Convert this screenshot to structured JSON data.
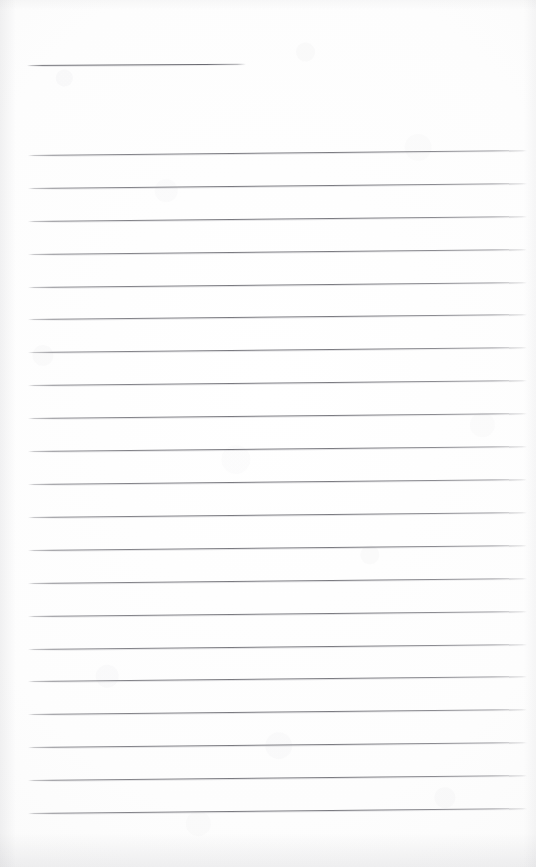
{
  "document": {
    "kind": "scanned-blank-ruled-page",
    "title": "Blank Ruled Notepad Page",
    "page_width": 536,
    "page_height": 867,
    "paper_color": "#fefefe",
    "rule_color": "#7a7a80",
    "rule_thickness_px": 1,
    "has_written_content": false,
    "has_handwriting": false,
    "has_margin_rule": false,
    "content_text": ""
  },
  "header_rule": {
    "label": "header-rule",
    "x": 27,
    "y": 65,
    "width": 219,
    "skew_deg": -0.35
  },
  "ruling": {
    "label": "ruled-lines",
    "line_count": 21,
    "left_x": 28,
    "right_x": 527,
    "first_line_y": 155,
    "line_spacing_px": 32.9,
    "skew_deg": -0.55,
    "lines": [
      {
        "index": 1,
        "y": 155
      },
      {
        "index": 2,
        "y": 188
      },
      {
        "index": 3,
        "y": 221
      },
      {
        "index": 4,
        "y": 254
      },
      {
        "index": 5,
        "y": 287
      },
      {
        "index": 6,
        "y": 319
      },
      {
        "index": 7,
        "y": 352
      },
      {
        "index": 8,
        "y": 385
      },
      {
        "index": 9,
        "y": 418
      },
      {
        "index": 10,
        "y": 451
      },
      {
        "index": 11,
        "y": 484
      },
      {
        "index": 12,
        "y": 517
      },
      {
        "index": 13,
        "y": 550
      },
      {
        "index": 14,
        "y": 583
      },
      {
        "index": 15,
        "y": 616
      },
      {
        "index": 16,
        "y": 649
      },
      {
        "index": 17,
        "y": 681
      },
      {
        "index": 18,
        "y": 714
      },
      {
        "index": 19,
        "y": 747
      },
      {
        "index": 20,
        "y": 780
      },
      {
        "index": 21,
        "y": 813
      }
    ]
  }
}
